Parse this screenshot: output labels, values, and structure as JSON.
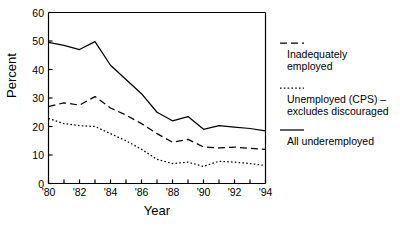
{
  "chart_data": {
    "type": "line",
    "title": "",
    "xlabel": "Year",
    "ylabel": "Percent",
    "xlim": [
      1980,
      1994
    ],
    "ylim": [
      0,
      60
    ],
    "grid": false,
    "legend_position": "right",
    "x": [
      1980,
      1981,
      1982,
      1983,
      1984,
      1985,
      1986,
      1987,
      1988,
      1989,
      1990,
      1991,
      1992,
      1993,
      1994
    ],
    "xtick_labels": [
      "'80",
      "'82",
      "'84",
      "'86",
      "'88",
      "'90",
      "'92",
      "'94"
    ],
    "xtick_values": [
      1980,
      1982,
      1984,
      1986,
      1988,
      1990,
      1992,
      1994
    ],
    "ytick_labels": [
      "0",
      "10",
      "20",
      "30",
      "40",
      "50",
      "60"
    ],
    "ytick_values": [
      0,
      10,
      20,
      30,
      40,
      50,
      60
    ],
    "series": [
      {
        "name": "Inadequately employed",
        "style": "dashed",
        "color": "#000000",
        "values": [
          27.0,
          28.3,
          27.5,
          30.5,
          26.5,
          24.0,
          21.0,
          17.5,
          14.5,
          15.5,
          12.8,
          12.5,
          12.8,
          12.3,
          12.0
        ]
      },
      {
        "name": "Unemployed (CPS) – excludes discouraged",
        "style": "dotted",
        "color": "#000000",
        "values": [
          22.8,
          21.0,
          20.3,
          20.0,
          17.5,
          15.0,
          12.0,
          8.5,
          7.0,
          7.5,
          6.0,
          7.8,
          7.5,
          7.0,
          6.3
        ]
      },
      {
        "name": "All underemployed",
        "style": "solid",
        "color": "#000000",
        "values": [
          49.5,
          48.5,
          47.0,
          49.8,
          41.5,
          36.5,
          31.5,
          25.0,
          22.0,
          23.5,
          19.0,
          20.3,
          19.8,
          19.3,
          18.5
        ]
      }
    ]
  },
  "legend": {
    "entries": [
      {
        "label_line1": "Inadequately",
        "label_line2": "employed",
        "style": "dashed"
      },
      {
        "label_line1": "Unemployed (CPS) –",
        "label_line2": "excludes discouraged",
        "style": "dotted"
      },
      {
        "label_line1": "All underemployed",
        "label_line2": "",
        "style": "solid"
      }
    ]
  },
  "axes": {
    "y_title": "Percent",
    "x_title": "Year"
  }
}
